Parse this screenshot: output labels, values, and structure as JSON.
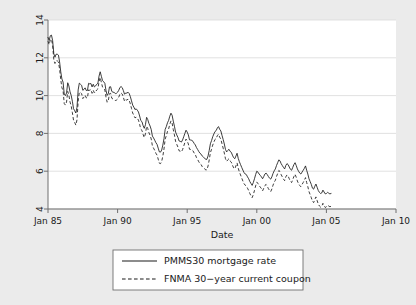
{
  "chart_data": {
    "type": "line",
    "title": "",
    "xlabel": "Date",
    "ylabel": "",
    "xlim": [
      "Jan 85",
      "Jan 10"
    ],
    "ylim": [
      4,
      14
    ],
    "yticks": [
      4,
      6,
      8,
      10,
      12,
      14
    ],
    "xticks": [
      "Jan 85",
      "Jan 90",
      "Jan 95",
      "Jan 00",
      "Jan 05",
      "Jan 10"
    ],
    "grid": "horizontal-faint",
    "legend_position": "below-plot",
    "x_start_year": 1985.0,
    "x_end_year": 2009.5,
    "x_step_years": 0.08333,
    "series": [
      {
        "name": "PMMS30 mortgage rate",
        "style": "solid",
        "values": [
          13.08,
          12.92,
          13.17,
          13.2,
          12.91,
          12.22,
          12.03,
          12.19,
          12.19,
          12.14,
          11.78,
          11.26,
          10.88,
          10.71,
          10.08,
          10.0,
          10.14,
          10.68,
          10.51,
          10.2,
          10.01,
          9.7,
          9.31,
          9.2,
          9.08,
          9.38,
          10.3,
          10.66,
          10.6,
          10.54,
          10.28,
          10.33,
          10.41,
          10.27,
          10.27,
          10.65,
          10.62,
          10.64,
          10.46,
          10.6,
          10.46,
          10.51,
          10.6,
          10.65,
          11.03,
          11.26,
          11.02,
          10.8,
          10.73,
          10.65,
          10.27,
          10.01,
          10.11,
          10.46,
          10.47,
          10.22,
          10.18,
          10.17,
          10.11,
          10.12,
          10.18,
          10.28,
          10.43,
          10.48,
          10.42,
          10.26,
          10.07,
          10.14,
          10.13,
          10.18,
          10.11,
          9.94,
          9.72,
          9.5,
          9.39,
          9.26,
          9.3,
          9.23,
          9.13,
          8.92,
          8.68,
          8.62,
          8.41,
          8.27,
          8.46,
          8.85,
          8.73,
          8.53,
          8.39,
          8.2,
          7.86,
          7.76,
          7.64,
          7.51,
          7.42,
          7.22,
          7.02,
          7.01,
          7.12,
          7.38,
          7.73,
          8.21,
          8.36,
          8.56,
          8.69,
          8.91,
          9.07,
          8.96,
          8.65,
          8.38,
          8.07,
          7.92,
          7.79,
          7.6,
          7.58,
          7.54,
          7.65,
          7.82,
          8.0,
          8.17,
          8.07,
          7.92,
          7.66,
          7.65,
          7.63,
          7.58,
          7.47,
          7.39,
          7.25,
          7.15,
          7.04,
          6.95,
          6.9,
          6.8,
          6.74,
          6.7,
          6.62,
          6.63,
          6.81,
          7.1,
          7.45,
          7.62,
          7.82,
          7.97,
          8.1,
          8.15,
          8.29,
          8.36,
          8.22,
          8.13,
          7.9,
          7.68,
          7.44,
          7.15,
          7.02,
          7.1,
          7.16,
          7.05,
          7.0,
          6.85,
          6.72,
          6.66,
          6.8,
          6.95,
          6.68,
          6.5,
          6.35,
          6.2,
          6.06,
          5.93,
          5.85,
          5.82,
          5.7,
          5.6,
          5.45,
          5.35,
          5.25,
          5.4,
          5.6,
          5.82,
          6.0,
          5.95,
          5.85,
          5.78,
          5.7,
          5.6,
          5.72,
          5.85,
          5.9,
          5.82,
          5.72,
          5.63,
          5.58,
          5.7,
          5.88,
          6.02,
          6.12,
          6.3,
          6.45,
          6.6,
          6.55,
          6.4,
          6.3,
          6.2,
          6.12,
          6.3,
          6.4,
          6.35,
          6.22,
          6.1,
          6.05,
          6.2,
          6.35,
          6.45,
          6.3,
          6.12,
          6.0,
          5.9,
          5.85,
          5.95,
          6.05,
          6.15,
          6.28,
          6.05,
          5.85,
          5.6,
          5.45,
          5.3,
          5.1,
          5.05,
          5.2,
          5.32,
          5.15,
          4.98,
          4.88,
          4.82,
          4.85,
          5.0,
          4.9,
          4.8,
          4.82,
          4.88,
          4.84,
          4.8,
          4.82
        ]
      },
      {
        "name": "FNMA 30-year current coupon",
        "style": "dashed",
        "values": [
          12.88,
          12.7,
          12.95,
          12.98,
          12.66,
          11.9,
          11.7,
          11.85,
          11.84,
          11.78,
          11.4,
          10.84,
          10.42,
          10.25,
          9.58,
          9.5,
          9.66,
          10.22,
          10.02,
          9.66,
          9.45,
          9.1,
          8.7,
          8.58,
          8.44,
          8.72,
          9.7,
          10.18,
          10.16,
          10.1,
          9.84,
          9.92,
          10.02,
          9.88,
          9.88,
          10.3,
          10.28,
          10.32,
          10.12,
          10.28,
          10.14,
          10.2,
          10.3,
          10.36,
          10.74,
          10.96,
          10.7,
          10.45,
          10.38,
          10.3,
          9.92,
          9.65,
          9.74,
          10.1,
          10.12,
          9.86,
          9.82,
          9.8,
          9.74,
          9.76,
          9.82,
          9.92,
          10.08,
          10.14,
          10.08,
          9.9,
          9.7,
          9.78,
          9.76,
          9.82,
          9.74,
          9.56,
          9.32,
          9.08,
          8.96,
          8.82,
          8.86,
          8.8,
          8.7,
          8.48,
          8.22,
          8.16,
          7.94,
          7.78,
          7.98,
          8.38,
          8.26,
          8.04,
          7.9,
          7.7,
          7.34,
          7.22,
          7.1,
          6.95,
          6.85,
          6.64,
          6.42,
          6.4,
          6.52,
          6.8,
          7.18,
          7.7,
          7.88,
          8.1,
          8.24,
          8.48,
          8.66,
          8.54,
          8.2,
          7.92,
          7.58,
          7.42,
          7.28,
          7.08,
          7.06,
          7.02,
          7.14,
          7.32,
          7.52,
          7.7,
          7.6,
          7.44,
          7.16,
          7.15,
          7.13,
          7.08,
          6.96,
          6.88,
          6.72,
          6.62,
          6.5,
          6.4,
          6.35,
          6.24,
          6.18,
          6.14,
          6.06,
          6.08,
          6.28,
          6.6,
          6.98,
          7.16,
          7.38,
          7.54,
          7.68,
          7.74,
          7.88,
          7.96,
          7.8,
          7.7,
          7.45,
          7.22,
          6.96,
          6.66,
          6.52,
          6.6,
          6.66,
          6.54,
          6.48,
          6.32,
          6.18,
          6.12,
          6.28,
          6.44,
          6.16,
          5.96,
          5.8,
          5.64,
          5.48,
          5.34,
          5.26,
          5.22,
          5.1,
          4.98,
          4.82,
          4.7,
          4.6,
          4.76,
          4.98,
          5.22,
          5.42,
          5.36,
          5.24,
          5.16,
          5.08,
          4.96,
          5.1,
          5.24,
          5.3,
          5.2,
          5.08,
          4.98,
          4.92,
          5.06,
          5.26,
          5.42,
          5.52,
          5.72,
          5.88,
          6.04,
          5.98,
          5.82,
          5.7,
          5.58,
          5.5,
          5.7,
          5.8,
          5.74,
          5.6,
          5.46,
          5.4,
          5.56,
          5.72,
          5.84,
          5.68,
          5.48,
          5.34,
          5.24,
          5.18,
          5.3,
          5.4,
          5.52,
          5.66,
          5.4,
          5.18,
          4.92,
          4.76,
          4.6,
          4.4,
          4.34,
          4.5,
          4.64,
          4.45,
          4.26,
          4.16,
          4.1,
          4.14,
          4.3,
          4.18,
          4.08,
          4.12,
          4.2,
          4.16,
          4.12,
          4.14
        ]
      }
    ]
  },
  "axis": {
    "y_tick_labels": [
      "4",
      "6",
      "8",
      "10",
      "12",
      "14"
    ],
    "x_tick_labels": [
      "Jan 85",
      "Jan 90",
      "Jan 95",
      "Jan 00",
      "Jan 05",
      "Jan 10"
    ],
    "x_title": "Date"
  },
  "legend": {
    "items": [
      {
        "label": "PMMS30 mortgage rate",
        "style": "solid"
      },
      {
        "label": "FNMA 30−year current coupon",
        "style": "dashed"
      }
    ]
  },
  "colors": {
    "background": "#ebebeb",
    "plot_area": "#ffffff",
    "line": "#1a1a1a",
    "axis": "#6f6f6f",
    "grid": "#d9d9d9"
  }
}
